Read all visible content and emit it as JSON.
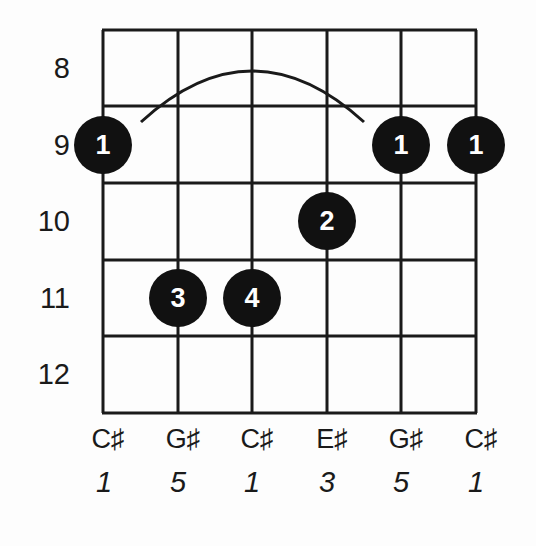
{
  "chord_diagram": {
    "fret_labels": [
      "8",
      "9",
      "10",
      "11",
      "12"
    ],
    "strings": [
      {
        "note": "C♯",
        "interval": "1",
        "fret": 9,
        "finger": "1"
      },
      {
        "note": "G♯",
        "interval": "5",
        "fret": 11,
        "finger": "3"
      },
      {
        "note": "C♯",
        "interval": "1",
        "fret": 11,
        "finger": "4"
      },
      {
        "note": "E♯",
        "interval": "3",
        "fret": 10,
        "finger": "2"
      },
      {
        "note": "G♯",
        "interval": "5",
        "fret": 9,
        "finger": "1"
      },
      {
        "note": "C♯",
        "interval": "1",
        "fret": 9,
        "finger": "1"
      }
    ],
    "barre": {
      "fret": 9,
      "finger": "1",
      "from_string": 1,
      "to_string": 5
    },
    "colors": {
      "line": "#1a1a1a",
      "dot": "#111111",
      "dot_text": "#ffffff",
      "background": "#fdfdfd"
    }
  }
}
